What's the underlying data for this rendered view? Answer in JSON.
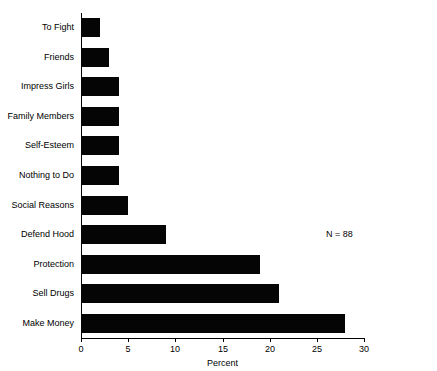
{
  "chart_data": {
    "type": "bar",
    "orientation": "horizontal",
    "title": "",
    "xlabel": "Percent",
    "ylabel": "",
    "xlim": [
      0,
      30
    ],
    "xticks": [
      0,
      5,
      10,
      15,
      20,
      25,
      30
    ],
    "xtick_labels": [
      "0",
      "5",
      "10",
      "15",
      "20",
      "25",
      "30"
    ],
    "grid": false,
    "legend": null,
    "bar_color": "#050505",
    "categories": [
      "To Fight",
      "Friends",
      "Impress Girls",
      "Family Members",
      "Self-Esteem",
      "Nothing to Do",
      "Social Reasons",
      "Defend Hood",
      "Protection",
      "Sell Drugs",
      "Make Money"
    ],
    "values": [
      2,
      3,
      4,
      4,
      4,
      4,
      5,
      9,
      19,
      21,
      28
    ],
    "annotations": [
      {
        "text": "N = 88",
        "x": 26,
        "y": "Defend Hood"
      }
    ]
  }
}
